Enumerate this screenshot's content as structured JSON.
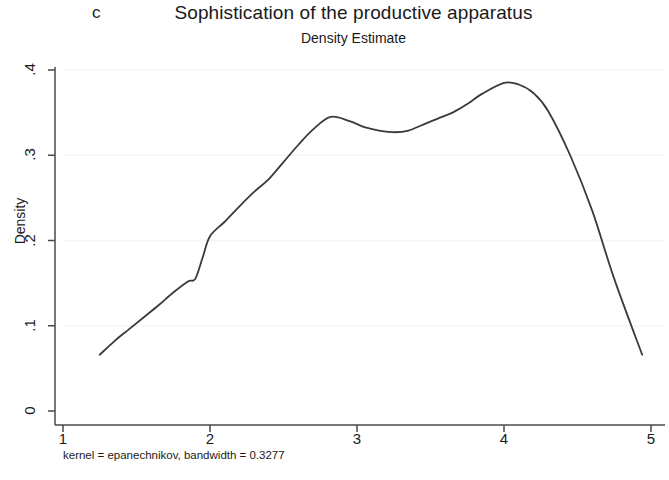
{
  "panel": {
    "label": "c"
  },
  "titles": {
    "title": "Sophistication of the productive apparatus",
    "subtitle": "Density Estimate"
  },
  "footnote": "kernel = epanechnikov, bandwidth = 0.3277",
  "colors": {
    "line": "#3a3a3a",
    "axis": "#4a4a4a",
    "grid": "#f4f4f6",
    "background": "#ffffff",
    "text": "#1a1a1a"
  },
  "chart_data": {
    "type": "line",
    "title": "Sophistication of the productive apparatus",
    "subtitle": "Density Estimate",
    "xlabel": "",
    "ylabel": "Density",
    "xlim": [
      1,
      5
    ],
    "ylim": [
      0,
      0.4
    ],
    "xticks": [
      "1",
      "2",
      "3",
      "4",
      "5"
    ],
    "xtick_values": [
      1,
      2,
      3,
      4,
      5
    ],
    "yticks": [
      "0",
      ".1",
      ".2",
      ".3",
      ".4"
    ],
    "ytick_values": [
      0,
      0.1,
      0.2,
      0.3,
      0.4
    ],
    "grid": true,
    "grid_axis": "y",
    "legend": null,
    "annotations": [
      "kernel = epanechnikov, bandwidth = 0.3277"
    ],
    "series": [
      {
        "name": "Density",
        "x": [
          1.25,
          1.35,
          1.45,
          1.55,
          1.65,
          1.75,
          1.85,
          1.9,
          1.95,
          2.0,
          2.1,
          2.2,
          2.3,
          2.4,
          2.5,
          2.6,
          2.7,
          2.82,
          2.95,
          3.05,
          3.15,
          3.26,
          3.35,
          3.45,
          3.55,
          3.65,
          3.75,
          3.85,
          4.0,
          4.1,
          4.2,
          4.3,
          4.45,
          4.6,
          4.75,
          4.94
        ],
        "y": [
          0.066,
          0.082,
          0.096,
          0.11,
          0.124,
          0.139,
          0.152,
          0.155,
          0.18,
          0.205,
          0.222,
          0.24,
          0.257,
          0.272,
          0.292,
          0.312,
          0.33,
          0.345,
          0.34,
          0.333,
          0.329,
          0.327,
          0.329,
          0.336,
          0.343,
          0.35,
          0.36,
          0.372,
          0.385,
          0.383,
          0.373,
          0.352,
          0.3,
          0.235,
          0.155,
          0.066
        ]
      }
    ]
  }
}
